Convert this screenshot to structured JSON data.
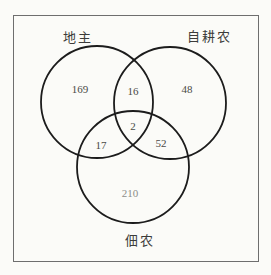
{
  "diagram": {
    "type": "venn-3",
    "sets": [
      {
        "id": "landlord",
        "label": "地主"
      },
      {
        "id": "self-farming-peasant",
        "label": "自耕农"
      },
      {
        "id": "tenant-farmer",
        "label": "佃农"
      }
    ],
    "regions": {
      "landlord_only": "169",
      "landlord_and_self": "16",
      "self_only": "48",
      "all_three": "2",
      "landlord_and_tenant": "17",
      "self_and_tenant": "52",
      "tenant_only": "210"
    },
    "colors": {
      "circle_stroke": "#1c1c1c",
      "border": "#6e6e6e",
      "background": "#fbfbf8",
      "label_text": "#3c3c3a",
      "value_text": "#4a4a46",
      "faded_value_text": "#8d8d89"
    }
  }
}
